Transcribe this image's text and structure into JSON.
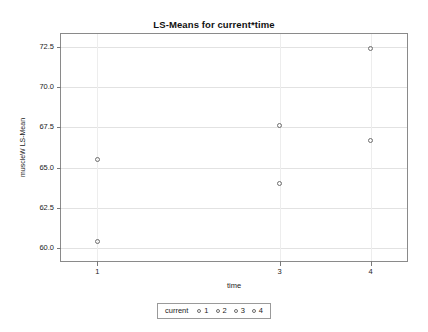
{
  "chart_data": {
    "type": "scatter",
    "title": "LS-Means for current*time",
    "xlabel": "time",
    "ylabel": "muscleW LS-Mean",
    "xlim": [
      0.6,
      4.4
    ],
    "ylim": [
      59.2,
      73.3
    ],
    "xticks": [
      "1",
      "3",
      "4"
    ],
    "xtick_values": [
      1,
      3,
      4
    ],
    "yticks": [
      "60.0",
      "62.5",
      "65.0",
      "67.5",
      "70.0",
      "72.5"
    ],
    "ytick_values": [
      60.0,
      62.5,
      65.0,
      67.5,
      70.0,
      72.5
    ],
    "grid": true,
    "legend_position": "bottom",
    "legend_title": "current",
    "marker": "open-circle",
    "marker_color": "#6e6e6e",
    "series": [
      {
        "name": "1",
        "x": [
          1,
          3,
          4
        ],
        "y": [
          65.5,
          64.0,
          66.7
        ]
      },
      {
        "name": "2",
        "x": [
          1,
          3,
          4
        ],
        "y": [
          60.4,
          67.6,
          72.4
        ]
      },
      {
        "name": "3",
        "x": [],
        "y": []
      },
      {
        "name": "4",
        "x": [],
        "y": []
      }
    ],
    "points": [
      {
        "x": 1,
        "y": 65.5
      },
      {
        "x": 1,
        "y": 60.4
      },
      {
        "x": 3,
        "y": 67.6
      },
      {
        "x": 3,
        "y": 64.0
      },
      {
        "x": 4,
        "y": 72.4
      },
      {
        "x": 4,
        "y": 66.7
      }
    ]
  },
  "legend": {
    "title": "current",
    "entries": [
      "1",
      "2",
      "3",
      "4"
    ]
  },
  "colors": {
    "frame": "#8a8a8a",
    "grid": "#e2e2e2",
    "marker": "#6e6e6e",
    "text": "#1c1c1c",
    "background": "#ffffff"
  }
}
